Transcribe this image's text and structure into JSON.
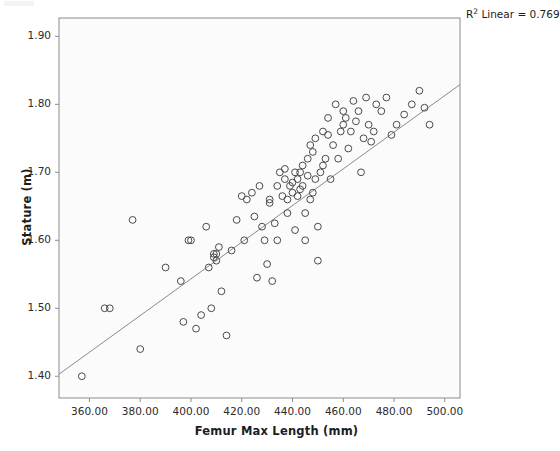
{
  "chart_data": {
    "type": "scatter",
    "title": "",
    "xlabel": "Femur Max Length (mm)",
    "ylabel": "Stature (m)",
    "xlim": [
      348,
      506
    ],
    "ylim": [
      1.368,
      1.927
    ],
    "xticks": [
      360,
      380,
      400,
      420,
      440,
      460,
      480,
      500
    ],
    "xtick_labels": [
      "360.00",
      "380.00",
      "400.00",
      "420.00",
      "440.00",
      "460.00",
      "480.00",
      "500.00"
    ],
    "yticks": [
      1.4,
      1.5,
      1.6,
      1.7,
      1.8,
      1.9
    ],
    "ytick_labels": [
      "1.40",
      "1.50",
      "1.60",
      "1.70",
      "1.80",
      "1.90"
    ],
    "grid": false,
    "legend": null,
    "annotation": "R² Linear = 0.769",
    "annotation_value": 0.769,
    "annotation_prefix": "R",
    "annotation_superscript": "2",
    "annotation_suffix": " Linear = 0.769",
    "marker": {
      "style": "open-circle",
      "radius": 3.4,
      "edge_color": "#4a4a4a",
      "fill": "none"
    },
    "fit_line": {
      "type": "linear",
      "color": "#8a8a8a",
      "width": 1,
      "x_start": 348.0,
      "y_start": 1.403,
      "x_end": 513.0,
      "y_end": 1.848
    },
    "x": [
      357,
      366,
      368,
      377,
      380,
      390,
      396,
      397,
      399,
      400,
      402,
      404,
      406,
      407,
      408,
      409,
      409,
      410,
      410,
      411,
      412,
      414,
      416,
      418,
      420,
      421,
      422,
      424,
      425,
      426,
      427,
      428,
      429,
      430,
      431,
      431,
      432,
      433,
      434,
      434,
      435,
      436,
      437,
      437,
      438,
      438,
      439,
      440,
      440,
      441,
      441,
      442,
      442,
      443,
      443,
      444,
      444,
      445,
      445,
      446,
      446,
      447,
      447,
      448,
      448,
      449,
      449,
      450,
      450,
      451,
      452,
      452,
      453,
      454,
      454,
      455,
      456,
      457,
      458,
      459,
      460,
      460,
      461,
      462,
      463,
      464,
      465,
      466,
      467,
      468,
      469,
      470,
      471,
      472,
      473,
      475,
      477,
      479,
      481,
      484,
      487,
      490,
      492,
      494
    ],
    "y": [
      1.4,
      1.5,
      1.5,
      1.63,
      1.44,
      1.56,
      1.54,
      1.48,
      1.6,
      1.6,
      1.47,
      1.49,
      1.62,
      1.56,
      1.5,
      1.58,
      1.575,
      1.58,
      1.57,
      1.59,
      1.525,
      1.46,
      1.585,
      1.63,
      1.665,
      1.6,
      1.66,
      1.67,
      1.635,
      1.545,
      1.68,
      1.62,
      1.6,
      1.565,
      1.66,
      1.655,
      1.54,
      1.625,
      1.68,
      1.6,
      1.7,
      1.665,
      1.705,
      1.69,
      1.66,
      1.64,
      1.68,
      1.685,
      1.67,
      1.7,
      1.615,
      1.69,
      1.665,
      1.7,
      1.675,
      1.71,
      1.68,
      1.64,
      1.6,
      1.72,
      1.695,
      1.74,
      1.66,
      1.73,
      1.67,
      1.75,
      1.69,
      1.62,
      1.57,
      1.7,
      1.76,
      1.71,
      1.72,
      1.78,
      1.755,
      1.69,
      1.74,
      1.8,
      1.72,
      1.76,
      1.79,
      1.77,
      1.78,
      1.735,
      1.76,
      1.805,
      1.775,
      1.79,
      1.7,
      1.75,
      1.81,
      1.77,
      1.745,
      1.76,
      1.8,
      1.79,
      1.81,
      1.755,
      1.77,
      1.785,
      1.8,
      1.82,
      1.795,
      1.77
    ]
  },
  "plot_frame": {
    "left": 59,
    "top": 18,
    "right": 460,
    "bottom": 398,
    "background": "#fbfbfb",
    "border_color": "#8c8c8c"
  },
  "colors": {
    "page_background": "#ffffff",
    "marker_edge": "#4a4a4a",
    "fit_line": "#8a8a8a",
    "text": "#1d1d1d",
    "axis": "#8c8c8c"
  }
}
